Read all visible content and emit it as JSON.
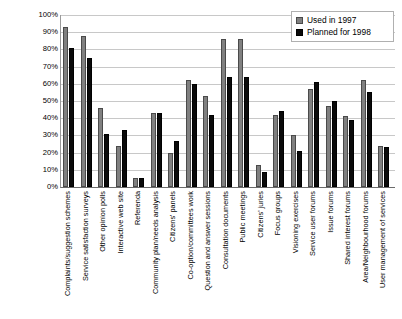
{
  "chart_data": {
    "type": "bar",
    "title": "",
    "xlabel": "",
    "ylabel": "Per cent of authorities",
    "ylim": [
      0,
      100
    ],
    "ytick_labels": [
      "100%",
      "90%",
      "80%",
      "70%",
      "60%",
      "50%",
      "40%",
      "30%",
      "20%",
      "10%",
      "0%"
    ],
    "ytick_values": [
      100,
      90,
      80,
      70,
      60,
      50,
      40,
      30,
      20,
      10,
      0
    ],
    "grid": true,
    "legend_position": "top-right",
    "categories": [
      "Complaints/suggestion schemes",
      "Service satisfaction surveys",
      "Other opinion polls",
      "Interactive web site",
      "Referenda",
      "Community plan/needs analysis",
      "Citizens' panels",
      "Co-option/committees work",
      "Question and answer sessions",
      "Consultation documents",
      "Public meetings",
      "Citizens' juries",
      "Focus groups",
      "Visioning exercises",
      "Service user forums",
      "Issue forums",
      "Shared interest forums",
      "Area/Neighbourhood forums",
      "User management of services"
    ],
    "series": [
      {
        "name": "Used in 1997",
        "color": "#808080",
        "values": [
          93,
          88,
          46,
          24,
          5,
          43,
          20,
          62,
          53,
          86,
          86,
          13,
          42,
          30,
          57,
          47,
          41,
          62,
          24
        ]
      },
      {
        "name": "Planned for 1998",
        "color": "#0a0a0a",
        "values": [
          81,
          75,
          31,
          33,
          5,
          43,
          27,
          60,
          42,
          64,
          64,
          9,
          44,
          21,
          61,
          50,
          39,
          55,
          23
        ]
      }
    ]
  },
  "legend": {
    "items": [
      {
        "label": "Used in 1997"
      },
      {
        "label": "Planned for 1998"
      }
    ]
  }
}
